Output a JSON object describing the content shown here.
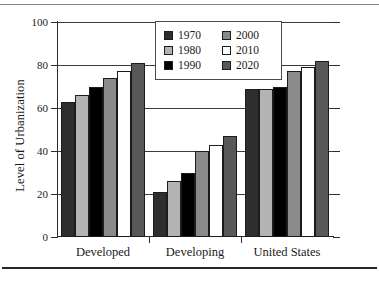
{
  "chart_data": {
    "type": "bar",
    "title": "",
    "xlabel": "",
    "ylabel": "Level of Urbanization",
    "ylim": [
      0,
      100
    ],
    "yticks": [
      0,
      20,
      40,
      60,
      80,
      100
    ],
    "ytick_labels": [
      "0",
      "20",
      "40",
      "60",
      "80",
      "100"
    ],
    "grid": true,
    "legend_position": "upper center",
    "categories": [
      "Developed",
      "Developing",
      "United States"
    ],
    "series": [
      {
        "name": "1970",
        "color": "#2e2e2e",
        "values": [
          63,
          21,
          69
        ]
      },
      {
        "name": "1980",
        "color": "#b3b3b3",
        "values": [
          66,
          26,
          69
        ]
      },
      {
        "name": "1990",
        "color": "#000000",
        "values": [
          70,
          30,
          70
        ]
      },
      {
        "name": "2000",
        "color": "#8a8a8a",
        "values": [
          74,
          40,
          77
        ]
      },
      {
        "name": "2010",
        "color": "#ffffff",
        "values": [
          77,
          43,
          79
        ]
      },
      {
        "name": "2020",
        "color": "#585858",
        "values": [
          81,
          47,
          82
        ]
      }
    ]
  },
  "legend": {
    "entries": [
      {
        "label": "1970"
      },
      {
        "label": "2000"
      },
      {
        "label": "1980"
      },
      {
        "label": "2010"
      },
      {
        "label": "1990"
      },
      {
        "label": "2020"
      }
    ]
  },
  "axis": {
    "y_title": "Level of Urbanization",
    "y_labels": [
      "100",
      "80",
      "60",
      "40",
      "20",
      "0"
    ],
    "x_labels": [
      "Developed",
      "Developing",
      "United States"
    ]
  }
}
